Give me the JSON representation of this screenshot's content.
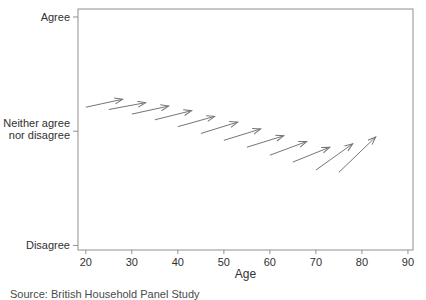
{
  "caption": "Source: British Household Panel Study",
  "colors": {
    "axis": "#8f8f8f",
    "text": "#303030",
    "arrow": "#757575",
    "background": "#ffffff"
  },
  "chart_data": {
    "type": "quiver",
    "title": "",
    "xlabel": "Age",
    "ylabel": "",
    "xlim": [
      18.3,
      91.1
    ],
    "ylim": [
      0.96,
      3.07
    ],
    "x_ticks": [
      20,
      30,
      40,
      50,
      60,
      70,
      80,
      90
    ],
    "y_ticks": [
      {
        "value": 3,
        "label": "Agree"
      },
      {
        "value": 2,
        "label": "Neither agree\nnor disagree"
      },
      {
        "value": 1,
        "label": "Disagree"
      }
    ],
    "grid": false,
    "legend": false,
    "series_note": "Each arrow is a birth-cohort trajectory: attitude level (1=Disagree, 2=Neither, 3=Agree) from starting age to ending age",
    "arrows": [
      {
        "age": [
          20,
          28
        ],
        "value": [
          2.21,
          2.28
        ]
      },
      {
        "age": [
          25,
          33
        ],
        "value": [
          2.19,
          2.25
        ]
      },
      {
        "age": [
          30,
          38
        ],
        "value": [
          2.15,
          2.22
        ]
      },
      {
        "age": [
          35,
          43
        ],
        "value": [
          2.1,
          2.18
        ]
      },
      {
        "age": [
          40,
          48
        ],
        "value": [
          2.04,
          2.13
        ]
      },
      {
        "age": [
          45,
          53
        ],
        "value": [
          1.98,
          2.08
        ]
      },
      {
        "age": [
          50,
          58
        ],
        "value": [
          1.92,
          2.02
        ]
      },
      {
        "age": [
          55,
          63
        ],
        "value": [
          1.86,
          1.96
        ]
      },
      {
        "age": [
          60,
          68
        ],
        "value": [
          1.79,
          1.91
        ]
      },
      {
        "age": [
          65,
          73
        ],
        "value": [
          1.73,
          1.86
        ]
      },
      {
        "age": [
          70,
          78
        ],
        "value": [
          1.66,
          1.89
        ]
      },
      {
        "age": [
          75,
          83
        ],
        "value": [
          1.64,
          1.95
        ]
      }
    ]
  }
}
